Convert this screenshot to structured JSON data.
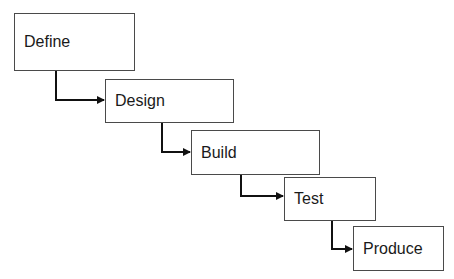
{
  "diagram": {
    "type": "waterfall",
    "colors": {
      "box_border": "#4a4a4a",
      "connector": "#111111",
      "text": "#1a1a1a",
      "background": "#ffffff"
    },
    "stages": [
      {
        "label": "Define",
        "x": 14,
        "y": 13,
        "w": 121,
        "h": 58
      },
      {
        "label": "Design",
        "x": 105,
        "y": 79,
        "w": 129,
        "h": 44
      },
      {
        "label": "Build",
        "x": 191,
        "y": 130,
        "w": 129,
        "h": 45
      },
      {
        "label": "Test",
        "x": 284,
        "y": 177,
        "w": 92,
        "h": 44
      },
      {
        "label": "Produce",
        "x": 353,
        "y": 226,
        "w": 91,
        "h": 45
      }
    ],
    "connectors": [
      {
        "from": "Define",
        "to": "Design",
        "x": 56,
        "y1": 71,
        "y2": 100,
        "x2": 105
      },
      {
        "from": "Design",
        "to": "Build",
        "x": 162,
        "y1": 123,
        "y2": 152,
        "x2": 191
      },
      {
        "from": "Build",
        "to": "Test",
        "x": 241,
        "y1": 175,
        "y2": 196,
        "x2": 284
      },
      {
        "from": "Test",
        "to": "Produce",
        "x": 332,
        "y1": 221,
        "y2": 249,
        "x2": 353
      }
    ]
  }
}
